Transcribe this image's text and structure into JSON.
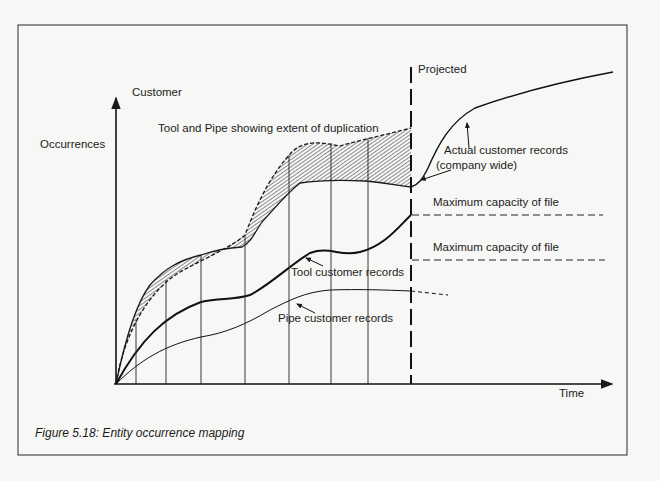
{
  "figure": {
    "caption": "Figure 5.18: Entity occurrence mapping",
    "y_axis_label_line1": "Customer",
    "y_axis_label_line2": "Occurrences",
    "x_axis_label": "Time",
    "projected_label": "Projected",
    "duplication_label": "Tool and Pipe showing extent of duplication",
    "actual_label_line1": "Actual customer records",
    "actual_label_line2": "(company wide)",
    "max_capacity_1": "Maximum capacity of file",
    "max_capacity_2": "Maximum capacity of file",
    "tool_label": "Tool customer records",
    "pipe_label": "Pipe customer records"
  },
  "colors": {
    "background": "#f7f7f5",
    "ink": "#1a1a1a"
  }
}
